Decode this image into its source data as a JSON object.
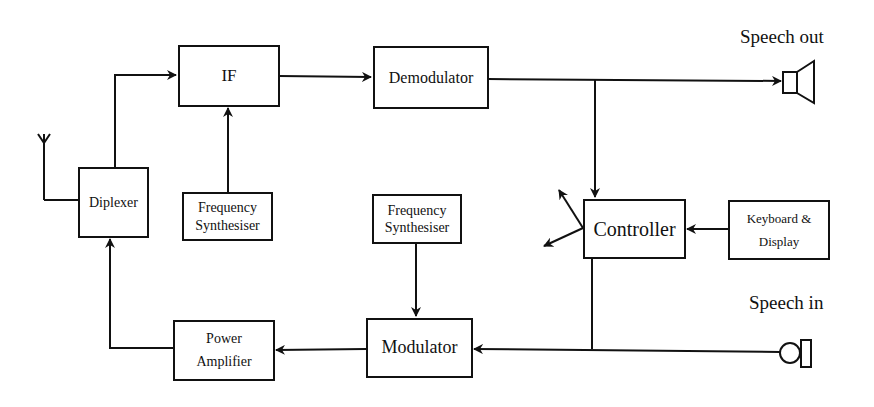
{
  "diagram": {
    "blocks": {
      "if": {
        "label": "IF"
      },
      "demodulator": {
        "label": "Demodulator"
      },
      "diplexer": {
        "label": "Diplexer"
      },
      "freq_synth_rx": {
        "line1": "Frequency",
        "line2": "Synthesiser"
      },
      "freq_synth_tx": {
        "line1": "Frequency",
        "line2": "Synthesiser"
      },
      "controller": {
        "label": "Controller"
      },
      "keyboard_display": {
        "line1": "Keyboard &",
        "line2": "Display"
      },
      "power_amplifier": {
        "line1": "Power",
        "line2": "Amplifier"
      },
      "modulator": {
        "label": "Modulator"
      }
    },
    "labels": {
      "speech_out": "Speech out",
      "speech_in": "Speech in"
    },
    "icons": [
      "antenna-icon",
      "speaker-icon",
      "microphone-icon"
    ],
    "colors": {
      "stroke": "#111111",
      "background": "#ffffff"
    }
  }
}
